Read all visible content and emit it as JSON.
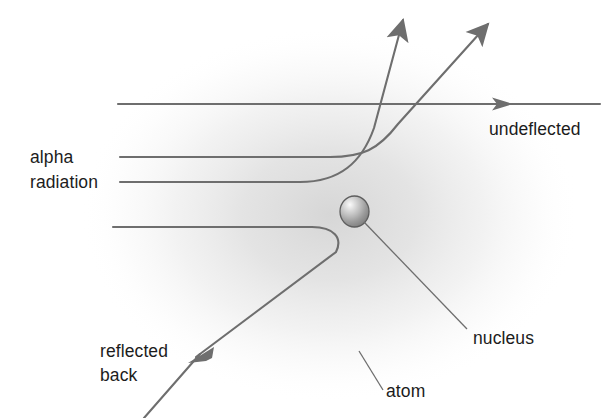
{
  "diagram": {
    "type": "physics-schematic",
    "canvas": {
      "width": 614,
      "height": 418
    },
    "colors": {
      "background": "#ffffff",
      "trajectory_line": "#6e6e6e",
      "leader_line": "#6e6e6e",
      "text": "#1c1c1c",
      "atom_haze": "#d8d8d8",
      "nucleus_light": "#f2f2f2",
      "nucleus_mid": "#b4b4b4",
      "nucleus_dark": "#7a7a7a",
      "nucleus_outline": "#5e5e5e"
    },
    "labels": {
      "alpha_line1": "alpha",
      "alpha_line2": "radiation",
      "undeflected": "undeflected",
      "reflected_line1": "reflected",
      "reflected_line2": "back",
      "nucleus": "nucleus",
      "atom": "atom"
    },
    "parts": {
      "nucleus": {
        "name": "nucleus",
        "cx": 354.5,
        "cy": 211.5,
        "rx": 14.5,
        "ry": 15.5
      },
      "atom_haze": {
        "name": "atom",
        "cx": 330,
        "cy": 215,
        "rx": 250,
        "ry": 185
      }
    },
    "trajectories": [
      {
        "name": "undeflected-beam",
        "description": "alpha particle passing far from nucleus, continues straight",
        "deflection_deg": 0,
        "has_arrowhead": true
      },
      {
        "name": "small-deflection-beam",
        "description": "alpha particle deflected at a shallow angle",
        "deflection_deg": 35,
        "has_arrowhead": true
      },
      {
        "name": "large-deflection-beam",
        "description": "alpha particle deflected at a steep angle",
        "deflection_deg": 62,
        "has_arrowhead": true
      },
      {
        "name": "back-scattered-beam",
        "description": "alpha particle reflected back along a near head-on approach",
        "deflection_deg": 145,
        "has_arrowhead": true
      }
    ],
    "leaders": [
      {
        "name": "nucleus-leader",
        "from": "nucleus",
        "to": "nucleus-label"
      },
      {
        "name": "atom-leader",
        "from": "atom-region",
        "to": "atom-label"
      }
    ]
  }
}
